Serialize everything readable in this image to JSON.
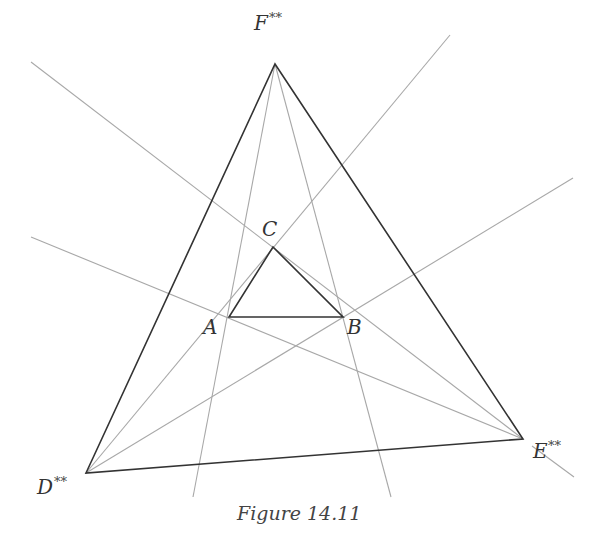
{
  "figure": {
    "caption": "Figure 14.11",
    "labels": {
      "F": {
        "letter": "F",
        "mark": "**"
      },
      "D": {
        "letter": "D",
        "mark": "**"
      },
      "E": {
        "letter": "E",
        "mark": "**"
      },
      "A": {
        "letter": "A"
      },
      "B": {
        "letter": "B"
      },
      "C": {
        "letter": "C"
      }
    },
    "colors": {
      "thick_line": "#333333",
      "thin_line": "#a8a8a8",
      "background": "#ffffff"
    }
  }
}
